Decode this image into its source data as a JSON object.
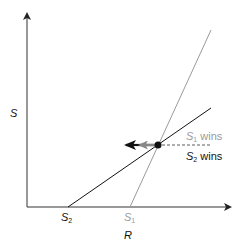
{
  "diagram": {
    "axes": {
      "y_label": "S",
      "x_label": "R"
    },
    "lines": [
      {
        "name": "S2 isocline",
        "color": "#111111"
      },
      {
        "name": "S1 isocline",
        "color": "#9a9a9a"
      }
    ],
    "x_intercepts": [
      {
        "base": "S",
        "sub": "2",
        "color": "#111111"
      },
      {
        "base": "S",
        "sub": "1",
        "color": "#9a9a9a"
      }
    ],
    "region_labels": [
      {
        "base": "S",
        "sub": "1",
        "text": " wins",
        "color": "#9a9a9a"
      },
      {
        "base": "S",
        "sub": "2",
        "text": " wins",
        "color": "#111111"
      }
    ],
    "arrows": [
      {
        "name": "S2 shift arrow",
        "color": "#111111",
        "direction": "left"
      },
      {
        "name": "S1 shift arrow",
        "color": "#888888",
        "direction": "left"
      }
    ],
    "colors": {
      "black": "#111111",
      "gray": "#9a9a9a",
      "arrow_gray": "#888888"
    }
  }
}
